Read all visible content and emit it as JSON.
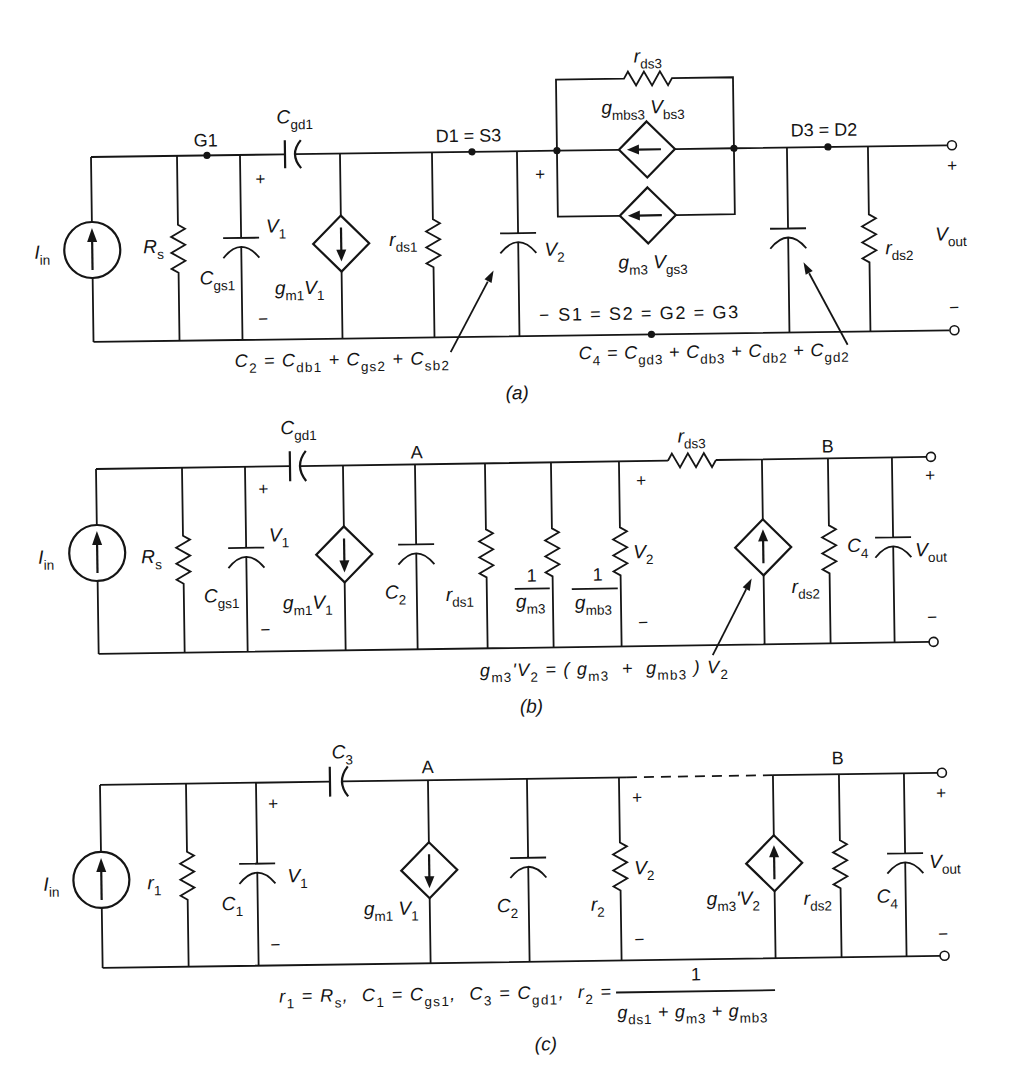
{
  "figure": {
    "panel_a": {
      "caption": "(a)",
      "labels": {
        "iin": "I_{in}",
        "rs": "R_{s}",
        "g1": "G1",
        "cgd1": "C_{gd1}",
        "v1_plus": "+",
        "v1": "V_{1}",
        "cgs1": "C_{gs1}",
        "v1_minus": "−",
        "gm1v1": "g_{m1}V_{1}",
        "rds1": "r_{ds1}",
        "d1_s3": "D1 = S3",
        "v2_plus": "+",
        "v2": "V_{2}",
        "v2_minus": "−",
        "rds3": "r_{ds3}",
        "gmbs3_vbs3": "g_{mbs3} V_{bs3}",
        "gm3_vgs3": "g_{m3} V_{gs3}",
        "d3_d2": "D3 = D2",
        "rds2": "r_{ds2}",
        "vout": "V_{out}",
        "vout_plus": "+",
        "vout_minus": "−",
        "common_node": "S1 = S2 = G2 = G3"
      },
      "annotations": {
        "c2": "C_{2} = C_{db1} + C_{gs2} + C_{sb2}",
        "c4": "C_{4} = C_{gd3} + C_{db3} + C_{db2} + C_{gd2}"
      }
    },
    "panel_b": {
      "caption": "(b)",
      "labels": {
        "iin": "I_{in}",
        "rs": "R_{s}",
        "cgd1": "C_{gd1}",
        "v1_plus": "+",
        "v1": "V_{1}",
        "cgs1": "C_{gs1}",
        "v1_minus": "−",
        "gm1v1": "g_{m1}V_{1}",
        "node_a": "A",
        "c2": "C_{2}",
        "rds1": "r_{ds1}",
        "inv_gm3": {
          "num": "1",
          "den": "g_{m3}"
        },
        "inv_gmb3": {
          "num": "1",
          "den": "g_{mb3}"
        },
        "v2_plus": "+",
        "v2": "V_{2}",
        "v2_minus": "−",
        "rds3": "r_{ds3}",
        "node_b": "B",
        "rds2": "r_{ds2}",
        "c4": "C_{4}",
        "vout": "V_{out}",
        "vout_plus": "+",
        "vout_minus": "−"
      },
      "annotations": {
        "gm3_prime": "g_{m3}'V_{2} = ( g_{m3}  +  g_{mb3} ) V_{2}"
      }
    },
    "panel_c": {
      "caption": "(c)",
      "labels": {
        "iin": "I_{in}",
        "r1": "r_{1}",
        "c1": "C_{1}",
        "v1_plus": "+",
        "v1": "V_{1}",
        "v1_minus": "−",
        "c3": "C_{3}",
        "node_a": "A",
        "gm1v1": "g_{m1} V_{1}",
        "c2": "C_{2}",
        "v2_plus": "+",
        "v2": "V_{2}",
        "r2": "r_{2}",
        "v2_minus": "−",
        "gm3_prime_v2": "g_{m3}'V_{2}",
        "node_b": "B",
        "rds2": "r_{ds2}",
        "c4": "C_{4}",
        "vout": "V_{out}",
        "vout_plus": "+",
        "vout_minus": "−"
      },
      "definitions": {
        "text": "r_{1} = R_{s},  C_{1} = C_{gs1},  C_{3} = C_{gd1},  r_{2} =",
        "r2_num": "1",
        "r2_den": "g_{ds1} + g_{m3} + g_{mb3}"
      }
    }
  }
}
